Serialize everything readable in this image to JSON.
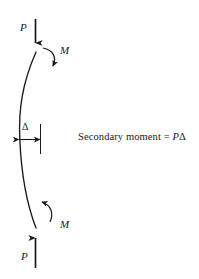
{
  "figure": {
    "title_text": "Secondary moment = PΔ",
    "background_color": "#ffffff",
    "ink_color": "#1a1a1a",
    "width": 199,
    "height": 279
  },
  "labels": {
    "load_top": "P",
    "load_bottom": "P",
    "moment_top": "M",
    "moment_bottom": "M",
    "deflection": "Δ"
  },
  "equation": {
    "lead": "Secondary moment = ",
    "force_symbol": "P",
    "deflection_symbol": "Δ"
  },
  "geometry": {
    "column_top_x": 36,
    "column_top_y": 52,
    "column_bottom_x": 36,
    "column_bottom_y": 228,
    "column_mid_bulge_x": 20,
    "reference_line_x": 40,
    "dimension_y": 139
  }
}
